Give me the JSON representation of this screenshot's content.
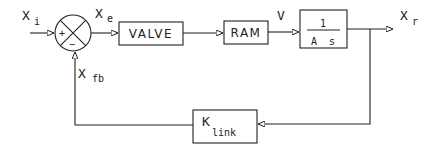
{
  "diagram": {
    "type": "block-diagram",
    "signals": {
      "input": {
        "main": "X",
        "sub": "i"
      },
      "error": {
        "main": "X",
        "sub": "e"
      },
      "velocity": {
        "main": "V"
      },
      "output": {
        "main": "X",
        "sub": "r"
      },
      "feedback": {
        "main": "X",
        "sub": "fb"
      }
    },
    "summing_junction": {
      "plus": "+",
      "minus": "−"
    },
    "blocks": {
      "valve": {
        "label": "VALVE"
      },
      "ram": {
        "label": "RAM"
      },
      "integrator": {
        "numerator": "1",
        "denominator": "A  s"
      },
      "link": {
        "main": "K",
        "sub": "link"
      }
    },
    "colors": {
      "line": "#222222",
      "background": "#ffffff"
    }
  }
}
